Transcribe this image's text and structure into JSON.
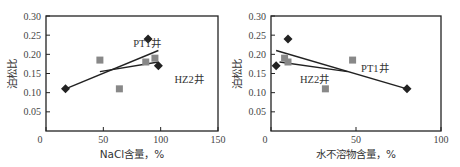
{
  "chart_data": [
    {
      "type": "scatter",
      "title": "",
      "xlabel": "NaCl含量，%",
      "ylabel": "泊松比",
      "xlim": [
        0,
        150
      ],
      "ylim": [
        0,
        0.3
      ],
      "xticks": [
        "0",
        "50",
        "100",
        "150"
      ],
      "yticks": [
        "0.05",
        "0.10",
        "0.15",
        "0.20",
        "0.25",
        "0.30"
      ],
      "grid": false,
      "legend": "none (series annotated inline)",
      "series": [
        {
          "name": "HZ2井",
          "marker": "diamond",
          "color": "#222222",
          "points": [
            [
              17,
              0.11
            ],
            [
              89,
              0.24
            ],
            [
              98,
              0.17
            ]
          ],
          "trendline": [
            [
              17,
              0.11
            ],
            [
              98,
              0.21
            ]
          ]
        },
        {
          "name": "PT1井",
          "marker": "square",
          "color": "#888888",
          "points": [
            [
              47,
              0.185
            ],
            [
              64,
              0.11
            ],
            [
              87,
              0.18
            ],
            [
              95,
              0.19
            ]
          ],
          "trendline": [
            [
              47,
              0.155
            ],
            [
              98,
              0.18
            ]
          ]
        }
      ],
      "annotations": [
        {
          "text": "PT1井",
          "x": 76,
          "y": 0.22
        },
        {
          "text": "HZ2井",
          "x": 112,
          "y": 0.125
        }
      ]
    },
    {
      "type": "scatter",
      "title": "",
      "xlabel": "水不溶物含量，%",
      "ylabel": "泊松比",
      "xlim": [
        0,
        100
      ],
      "ylim": [
        0,
        0.3
      ],
      "xticks": [
        "0",
        "50",
        "100"
      ],
      "yticks": [
        "0.05",
        "0.10",
        "0.15",
        "0.20",
        "0.25",
        "0.30"
      ],
      "grid": false,
      "legend": "none (series annotated inline)",
      "series": [
        {
          "name": "HZ2井",
          "marker": "diamond",
          "color": "#222222",
          "points": [
            [
              3,
              0.17
            ],
            [
              10,
              0.24
            ],
            [
              80,
              0.11
            ]
          ],
          "trendline": [
            [
              3,
              0.21
            ],
            [
              80,
              0.11
            ]
          ]
        },
        {
          "name": "PT1井",
          "marker": "square",
          "color": "#888888",
          "points": [
            [
              8,
              0.19
            ],
            [
              10,
              0.18
            ],
            [
              48,
              0.185
            ],
            [
              32,
              0.11
            ]
          ],
          "trendline": [
            [
              5,
              0.18
            ],
            [
              45,
              0.155
            ]
          ]
        }
      ],
      "annotations": [
        {
          "text": "PT1井",
          "x": 53,
          "y": 0.155
        },
        {
          "text": "HZ2井",
          "x": 17,
          "y": 0.125
        }
      ]
    }
  ]
}
